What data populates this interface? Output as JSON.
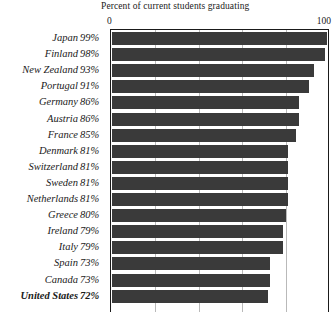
{
  "chart_data": {
    "type": "bar",
    "orientation": "horizontal",
    "title": "Percent of current students graduating",
    "xlabel": "",
    "ylabel": "",
    "xlim": [
      0,
      100
    ],
    "xticks": [
      0,
      100
    ],
    "xtick_labels": [
      "0",
      "100"
    ],
    "gridlines": [
      20,
      40,
      60,
      80
    ],
    "grid": true,
    "legend": "none",
    "bar_color": "#3a3a3a",
    "frame_color": "#1a1a1a",
    "gridline_color": "#b9b9b9",
    "background": "#ffffff",
    "highlight_category": "United States",
    "note": "Bottom row is clipped by the image edge.",
    "categories": [
      "Japan",
      "Finland",
      "New Zealand",
      "Portugal",
      "Germany",
      "Austria",
      "France",
      "Denmark",
      "Switzerland",
      "Sweden",
      "Netherlands",
      "Greece",
      "Ireland",
      "Italy",
      "Spain",
      "Canada",
      "United States"
    ],
    "values": [
      99,
      98,
      93,
      91,
      86,
      86,
      85,
      81,
      81,
      81,
      81,
      80,
      79,
      79,
      73,
      73,
      72
    ],
    "value_labels": [
      "99%",
      "98%",
      "93%",
      "91%",
      "86%",
      "86%",
      "85%",
      "81%",
      "81%",
      "81%",
      "81%",
      "80%",
      "79%",
      "79%",
      "73%",
      "73%",
      "72%"
    ]
  }
}
